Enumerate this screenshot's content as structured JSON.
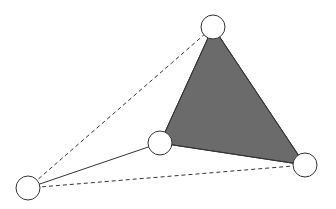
{
  "diagram": {
    "type": "graph",
    "background": "#ffffff",
    "colors": {
      "triangle_fill": "#6b6b6b",
      "stroke": "#333333",
      "node_fill": "#ffffff"
    },
    "node_radius": 12,
    "nodes": [
      {
        "id": "top",
        "x": 213,
        "y": 27
      },
      {
        "id": "middle",
        "x": 160,
        "y": 143
      },
      {
        "id": "right",
        "x": 305,
        "y": 165
      },
      {
        "id": "left",
        "x": 28,
        "y": 188
      }
    ],
    "filled_triangle": [
      "top",
      "middle",
      "right"
    ],
    "edges": [
      {
        "from": "top",
        "to": "middle",
        "style": "solid"
      },
      {
        "from": "middle",
        "to": "right",
        "style": "solid"
      },
      {
        "from": "top",
        "to": "right",
        "style": "solid"
      },
      {
        "from": "left",
        "to": "middle",
        "style": "solid"
      },
      {
        "from": "left",
        "to": "top",
        "style": "dashed"
      },
      {
        "from": "left",
        "to": "right",
        "style": "dashed"
      }
    ]
  }
}
